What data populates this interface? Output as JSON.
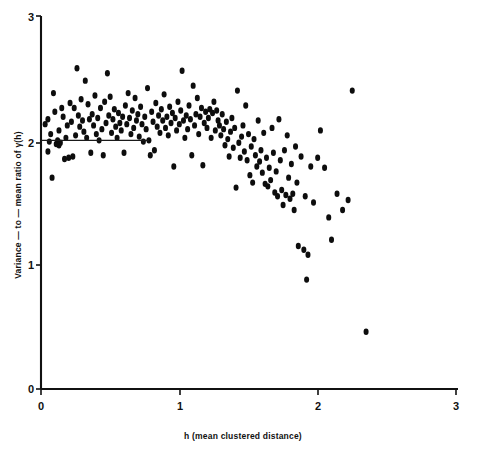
{
  "chart_data": {
    "type": "scatter",
    "title": "",
    "xlabel": "h (mean clustered distance)",
    "ylabel": "Variance — to — mean ratio of γ(h)",
    "xlim": [
      0,
      3
    ],
    "ylim": [
      0,
      3
    ],
    "xticks": [
      0,
      1,
      2,
      3
    ],
    "xticklabels": [
      "0",
      "1",
      "2",
      "3"
    ],
    "yticks": [
      0,
      1,
      2,
      3
    ],
    "yticklabels": [
      "0",
      "1",
      "2",
      "3"
    ],
    "grid": false,
    "legend": null,
    "marker": "filled-circle",
    "marker_color": "#0d0d0d",
    "annotations": [
      {
        "name": "reference-line",
        "type": "horizontal-segment",
        "y": 2.0,
        "x_start": 0.0,
        "x_end": 0.78
      }
    ],
    "points": [
      [
        0.03,
        2.13
      ],
      [
        0.05,
        2.17
      ],
      [
        0.05,
        1.91
      ],
      [
        0.06,
        1.99
      ],
      [
        0.07,
        2.05
      ],
      [
        0.08,
        1.7
      ],
      [
        0.09,
        2.38
      ],
      [
        0.1,
        2.23
      ],
      [
        0.11,
        1.97
      ],
      [
        0.12,
        2.0
      ],
      [
        0.13,
        1.96
      ],
      [
        0.13,
        2.08
      ],
      [
        0.14,
        1.98
      ],
      [
        0.15,
        2.26
      ],
      [
        0.16,
        2.19
      ],
      [
        0.17,
        1.85
      ],
      [
        0.18,
        2.02
      ],
      [
        0.19,
        2.12
      ],
      [
        0.2,
        1.86
      ],
      [
        0.21,
        2.3
      ],
      [
        0.22,
        2.15
      ],
      [
        0.23,
        1.87
      ],
      [
        0.24,
        2.26
      ],
      [
        0.25,
        2.04
      ],
      [
        0.26,
        2.58
      ],
      [
        0.27,
        2.2
      ],
      [
        0.28,
        2.11
      ],
      [
        0.29,
        2.33
      ],
      [
        0.3,
        2.16
      ],
      [
        0.31,
        2.07
      ],
      [
        0.32,
        2.48
      ],
      [
        0.33,
        2.02
      ],
      [
        0.34,
        2.29
      ],
      [
        0.35,
        2.17
      ],
      [
        0.36,
        1.9
      ],
      [
        0.37,
        2.21
      ],
      [
        0.38,
        2.12
      ],
      [
        0.39,
        2.36
      ],
      [
        0.4,
        2.05
      ],
      [
        0.41,
        2.18
      ],
      [
        0.42,
        2.0
      ],
      [
        0.43,
        2.26
      ],
      [
        0.44,
        2.09
      ],
      [
        0.45,
        1.88
      ],
      [
        0.46,
        2.31
      ],
      [
        0.47,
        2.14
      ],
      [
        0.48,
        2.54
      ],
      [
        0.49,
        2.2
      ],
      [
        0.5,
        2.35
      ],
      [
        0.51,
        2.06
      ],
      [
        0.52,
        2.17
      ],
      [
        0.53,
        2.25
      ],
      [
        0.54,
        2.11
      ],
      [
        0.55,
        2.02
      ],
      [
        0.56,
        2.22
      ],
      [
        0.57,
        2.14
      ],
      [
        0.58,
        2.08
      ],
      [
        0.59,
        2.19
      ],
      [
        0.6,
        1.9
      ],
      [
        0.61,
        2.28
      ],
      [
        0.62,
        2.13
      ],
      [
        0.63,
        2.38
      ],
      [
        0.64,
        2.18
      ],
      [
        0.65,
        2.05
      ],
      [
        0.66,
        2.24
      ],
      [
        0.67,
        2.1
      ],
      [
        0.68,
        2.34
      ],
      [
        0.69,
        2.16
      ],
      [
        0.7,
        2.21
      ],
      [
        0.71,
        2.03
      ],
      [
        0.72,
        2.27
      ],
      [
        0.73,
        2.13
      ],
      [
        0.74,
        1.99
      ],
      [
        0.75,
        2.19
      ],
      [
        0.76,
        2.09
      ],
      [
        0.77,
        2.42
      ],
      [
        0.78,
        2.0
      ],
      [
        0.79,
        1.88
      ],
      [
        0.8,
        2.23
      ],
      [
        0.81,
        2.15
      ],
      [
        0.82,
        1.92
      ],
      [
        0.83,
        2.3
      ],
      [
        0.84,
        2.11
      ],
      [
        0.85,
        2.2
      ],
      [
        0.86,
        2.06
      ],
      [
        0.87,
        2.25
      ],
      [
        0.88,
        2.16
      ],
      [
        0.89,
        2.37
      ],
      [
        0.9,
        2.1
      ],
      [
        0.91,
        2.19
      ],
      [
        0.92,
        2.04
      ],
      [
        0.93,
        2.27
      ],
      [
        0.94,
        2.14
      ],
      [
        0.95,
        2.22
      ],
      [
        0.96,
        1.79
      ],
      [
        0.97,
        2.18
      ],
      [
        0.98,
        2.08
      ],
      [
        0.99,
        2.31
      ],
      [
        1.0,
        2.13
      ],
      [
        1.01,
        2.24
      ],
      [
        1.02,
        2.56
      ],
      [
        1.03,
        2.16
      ],
      [
        1.04,
        2.02
      ],
      [
        1.05,
        2.2
      ],
      [
        1.06,
        2.09
      ],
      [
        1.07,
        2.28
      ],
      [
        1.08,
        2.17
      ],
      [
        1.09,
        1.88
      ],
      [
        1.1,
        2.44
      ],
      [
        1.11,
        2.12
      ],
      [
        1.12,
        2.21
      ],
      [
        1.13,
        2.34
      ],
      [
        1.14,
        2.05
      ],
      [
        1.15,
        2.19
      ],
      [
        1.16,
        2.26
      ],
      [
        1.17,
        1.8
      ],
      [
        1.18,
        2.14
      ],
      [
        1.19,
        2.23
      ],
      [
        1.2,
        2.1
      ],
      [
        1.21,
        2.18
      ],
      [
        1.22,
        2.25
      ],
      [
        1.23,
        2.02
      ],
      [
        1.24,
        2.22
      ],
      [
        1.25,
        2.31
      ],
      [
        1.26,
        2.08
      ],
      [
        1.27,
        2.24
      ],
      [
        1.28,
        2.16
      ],
      [
        1.29,
        2.12
      ],
      [
        1.3,
        2.04
      ],
      [
        1.31,
        2.21
      ],
      [
        1.32,
        2.09
      ],
      [
        1.33,
        1.96
      ],
      [
        1.34,
        2.15
      ],
      [
        1.35,
        2.01
      ],
      [
        1.36,
        1.87
      ],
      [
        1.37,
        2.07
      ],
      [
        1.38,
        2.18
      ],
      [
        1.39,
        1.94
      ],
      [
        1.4,
        2.1
      ],
      [
        1.41,
        1.62
      ],
      [
        1.42,
        2.4
      ],
      [
        1.43,
        1.98
      ],
      [
        1.44,
        1.86
      ],
      [
        1.45,
        2.03
      ],
      [
        1.46,
        2.12
      ],
      [
        1.47,
        1.91
      ],
      [
        1.48,
        2.28
      ],
      [
        1.49,
        1.84
      ],
      [
        1.5,
        2.05
      ],
      [
        1.51,
        1.72
      ],
      [
        1.52,
        1.95
      ],
      [
        1.53,
        1.66
      ],
      [
        1.54,
        2.01
      ],
      [
        1.55,
        1.88
      ],
      [
        1.56,
        1.79
      ],
      [
        1.57,
        2.16
      ],
      [
        1.58,
        1.83
      ],
      [
        1.59,
        1.92
      ],
      [
        1.6,
        1.74
      ],
      [
        1.61,
        2.06
      ],
      [
        1.62,
        1.65
      ],
      [
        1.63,
        1.86
      ],
      [
        1.64,
        1.63
      ],
      [
        1.65,
        1.78
      ],
      [
        1.66,
        1.68
      ],
      [
        1.67,
        2.1
      ],
      [
        1.68,
        1.9
      ],
      [
        1.69,
        1.58
      ],
      [
        1.7,
        1.75
      ],
      [
        1.71,
        1.55
      ],
      [
        1.72,
        2.17
      ],
      [
        1.73,
        1.84
      ],
      [
        1.74,
        1.6
      ],
      [
        1.75,
        1.48
      ],
      [
        1.76,
        1.92
      ],
      [
        1.77,
        1.56
      ],
      [
        1.78,
        2.04
      ],
      [
        1.79,
        1.7
      ],
      [
        1.8,
        1.53
      ],
      [
        1.81,
        1.81
      ],
      [
        1.82,
        1.57
      ],
      [
        1.83,
        1.44
      ],
      [
        1.84,
        1.95
      ],
      [
        1.85,
        1.66
      ],
      [
        1.86,
        1.15
      ],
      [
        1.88,
        1.87
      ],
      [
        1.9,
        1.12
      ],
      [
        1.91,
        1.55
      ],
      [
        1.92,
        0.88
      ],
      [
        1.93,
        1.08
      ],
      [
        1.95,
        1.79
      ],
      [
        1.97,
        1.5
      ],
      [
        2.0,
        1.86
      ],
      [
        2.02,
        2.08
      ],
      [
        2.05,
        1.78
      ],
      [
        2.08,
        1.38
      ],
      [
        2.1,
        1.2
      ],
      [
        2.14,
        1.57
      ],
      [
        2.18,
        1.44
      ],
      [
        2.22,
        1.52
      ],
      [
        2.25,
        2.4
      ],
      [
        2.35,
        0.46
      ]
    ]
  }
}
